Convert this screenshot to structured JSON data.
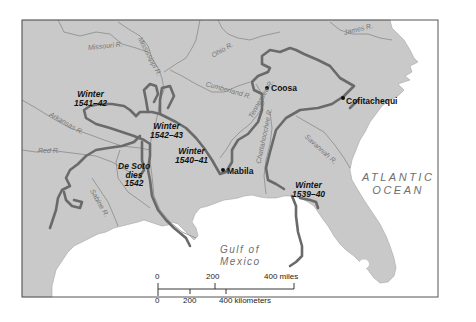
{
  "map": {
    "title": "De Soto's Expedition Route",
    "colors": {
      "land": "#c9c9c9",
      "water": "#ffffff",
      "route": "#6a6a6a",
      "rivers": "#8a8a8a",
      "frame": "#555555",
      "label_dark": "#111111",
      "label_water": "#6e6e6e"
    },
    "winter_camps": [
      {
        "line1": "Winter",
        "line2": "1541–42"
      },
      {
        "line1": "Winter",
        "line2": "1542–43"
      },
      {
        "line1": "Winter",
        "line2": "1540–41"
      },
      {
        "line1": "Winter",
        "line2": "1539–40"
      }
    ],
    "death_note": {
      "line1": "De Soto",
      "line2": "dies",
      "line3": "1542"
    },
    "places": [
      {
        "name": "Coosa",
        "marker": "dot"
      },
      {
        "name": "Cofitachequi",
        "marker": "dot"
      },
      {
        "name": "Mabila",
        "marker": "dot"
      }
    ],
    "water_bodies": {
      "atlantic_line1": "ATLANTIC",
      "atlantic_line2": "OCEAN",
      "gulf_line1": "Gulf of",
      "gulf_line2": "Mexico"
    },
    "rivers": [
      "Missouri R.",
      "Mississippi R.",
      "Ohio R.",
      "James R.",
      "Cumberland R.",
      "Arkansas R.",
      "Tennessee R.",
      "Red R.",
      "Sabine R.",
      "Chattahoochee R.",
      "Savannah R."
    ],
    "scale_bar": {
      "miles_ticks": [
        "0",
        "200",
        "400 miles"
      ],
      "km_ticks": [
        "0",
        "200",
        "400 kilometers"
      ]
    }
  }
}
